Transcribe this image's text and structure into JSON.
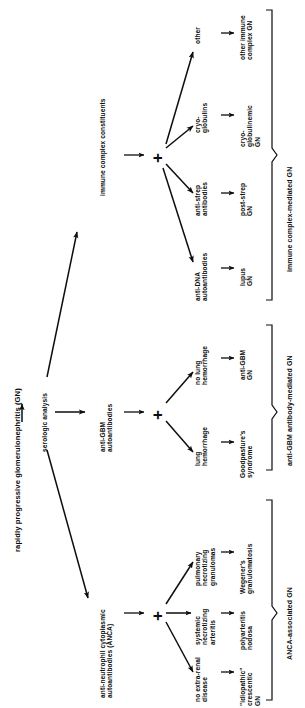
{
  "title": "rapidly progressive glomerulonephritis (GN)",
  "root": {
    "label": "serologic analysis"
  },
  "plus_symbol": "+",
  "branches": [
    {
      "id": "immune-complex",
      "category": "immune complex constituents",
      "group_label": "immune complex-mediated GN",
      "rows": [
        {
          "finding": "other",
          "diagnosis": "other immune\ncomplex GN"
        },
        {
          "finding": "cryo-\nglobulins",
          "diagnosis": "cryo-\nglobulinemic\nGN"
        },
        {
          "finding": "anti-strep\nantibodies",
          "diagnosis": "post-strep\nGN"
        },
        {
          "finding": "anti-DNA\nautoantibodies",
          "diagnosis": "lupus\nGN"
        }
      ]
    },
    {
      "id": "anti-gbm",
      "category": "anti-GBM\nautoantibodies",
      "group_label": "anti-GBM antibody-mediated GN",
      "rows": [
        {
          "finding": "no lung\nhemorrhage",
          "diagnosis": "anti-GBM\nGN"
        },
        {
          "finding": "lung\nhemorrhage",
          "diagnosis": "Goodpasture's\nsyndrome"
        }
      ]
    },
    {
      "id": "anca",
      "category": "anti-neutrophil cytoplasmic\nautoantibodies (ANCA)",
      "group_label": "ANCA-associated GN",
      "rows": [
        {
          "finding": "pulmonary\nnecrotizing\ngranulomas",
          "diagnosis": "Wegener's\ngranulomatosis"
        },
        {
          "finding": "systemic\nnecrotizing\narteritis",
          "diagnosis": "polyarteritis\nnodosa"
        },
        {
          "finding": "no extra-renal\ndisease",
          "diagnosis": "\"idiopathic\"\ncrescentic\nGN"
        }
      ]
    }
  ],
  "colors": {
    "ink": "#0d0d0d",
    "background": "#ffffff"
  }
}
